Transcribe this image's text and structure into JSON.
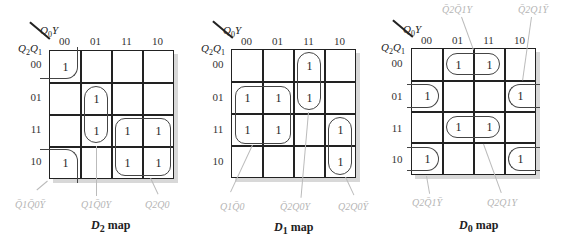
{
  "axis": {
    "column_var": "Q0Y",
    "row_var": "Q2Q1",
    "columns": [
      "00",
      "01",
      "11",
      "10"
    ],
    "rows": [
      "00",
      "01",
      "11",
      "10"
    ]
  },
  "maps": [
    {
      "name": "D2",
      "caption_var": "D",
      "caption_sub": "2",
      "caption_rest": " map",
      "cells": [
        [
          "1",
          "",
          "",
          ""
        ],
        [
          "",
          "1",
          "",
          ""
        ],
        [
          "",
          "1",
          "1",
          "1"
        ],
        [
          "1",
          "",
          "1",
          "1"
        ]
      ],
      "terms": [
        "Q̄1Q̄0Ȳ",
        "Q1Q̄0Y",
        "Q2Q0"
      ]
    },
    {
      "name": "D1",
      "caption_var": "D",
      "caption_sub": "1",
      "caption_rest": " map",
      "cells": [
        [
          "",
          "",
          "1",
          ""
        ],
        [
          "1",
          "1",
          "1",
          ""
        ],
        [
          "1",
          "1",
          "",
          "1"
        ],
        [
          "",
          "",
          "",
          "1"
        ]
      ],
      "terms": [
        "Q1Q̄0",
        "Q̄2Q0Y",
        "Q2Q0Ȳ"
      ]
    },
    {
      "name": "D0",
      "caption_var": "D",
      "caption_sub": "0",
      "caption_rest": " map",
      "cells": [
        [
          "",
          "1",
          "1",
          ""
        ],
        [
          "1",
          "",
          "",
          "1"
        ],
        [
          "",
          "1",
          "1",
          ""
        ],
        [
          "1",
          "",
          "",
          "1"
        ]
      ],
      "terms": [
        "Q̄2Q̄1Y",
        "Q̄2Q1Ȳ",
        "Q2Q̄1Ȳ",
        "Q2Q1Y"
      ]
    }
  ]
}
